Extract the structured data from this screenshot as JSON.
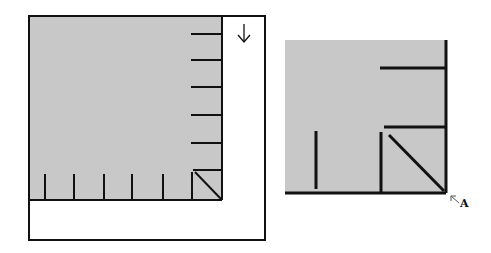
{
  "colors": {
    "fill": "#c8c8c8",
    "line": "#111111",
    "background": "#ffffff"
  },
  "left_panel": {
    "description": "Outer frame with gray square, tick marks along right and bottom edges, diagonal corner mark, and down arrow",
    "outer_frame": {
      "x": 29,
      "y": 16,
      "w": 236,
      "h": 224
    },
    "gray_square": {
      "x": 29,
      "y": 16,
      "w": 193,
      "h": 184
    },
    "right_ticks_y": [
      34,
      60,
      87,
      115,
      143,
      170
    ],
    "bottom_ticks_x": [
      45,
      74,
      104,
      132,
      163,
      192
    ],
    "arrow_icon": "down-arrow",
    "arrow_glyph": "↓"
  },
  "right_panel": {
    "description": "Enlarged corner detail with two horizontal ticks, two vertical ticks and a diagonal to corner A",
    "gray_square": {
      "x": 285,
      "y": 40,
      "w": 161,
      "h": 153
    },
    "horizontal_ticks": [
      {
        "x1": 380,
        "x2": 446,
        "y": 68
      },
      {
        "x1": 384,
        "x2": 446,
        "y": 127
      }
    ],
    "vertical_ticks": [
      {
        "x": 316,
        "y1": 131,
        "y2": 189
      },
      {
        "x": 381,
        "y1": 132,
        "y2": 193
      }
    ],
    "diagonal": {
      "x1": 388,
      "y1": 134,
      "x2": 444,
      "y2": 191
    },
    "corner_label": "A",
    "corner_arrow_glyph": "↖"
  }
}
